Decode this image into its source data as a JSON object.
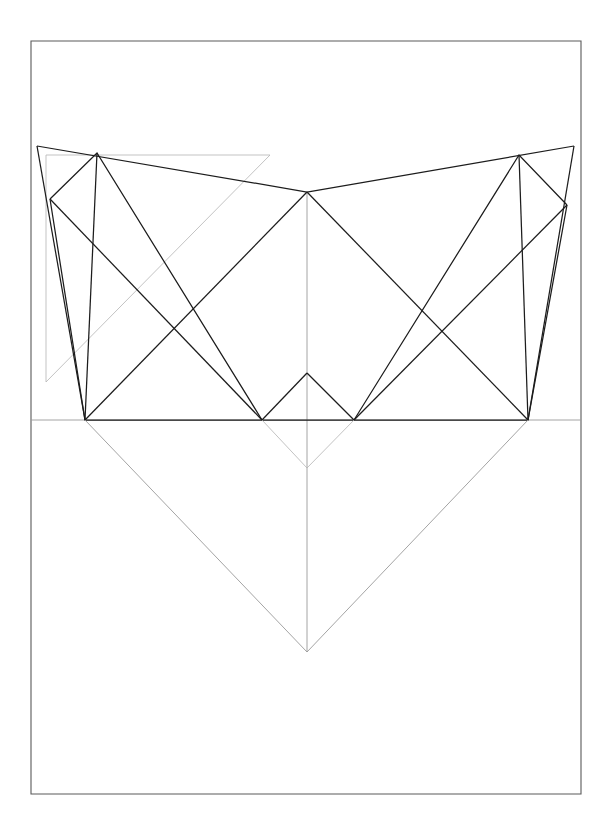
{
  "document": {
    "title": "Descriptive Geometry Construction Drawing",
    "kind": "technical-line-drawing",
    "background_color": "#ffffff",
    "canvas": {
      "width": 614,
      "height": 827
    }
  },
  "styles": {
    "border_color": "#5a5a5a",
    "primary_line_color": "#1c1c1c",
    "construction_line_color": "#9a9a9a",
    "faint_line_color": "#b4b4b4",
    "border_width": 1.1,
    "primary_width": 1.25,
    "construction_width": 0.9,
    "faint_width": 0.8
  },
  "chart_data": {
    "type": "line",
    "title": "Descriptive Geometry Construction Drawing",
    "xlabel": "",
    "ylabel": "",
    "xlim": [
      0,
      614
    ],
    "ylim": [
      0,
      827
    ],
    "grid": false,
    "legend": "none",
    "points": {
      "page_tl": [
        31,
        41
      ],
      "page_tr": [
        581,
        41
      ],
      "page_br": [
        581,
        794
      ],
      "page_bl": [
        31,
        794
      ],
      "apex_left": [
        37,
        146
      ],
      "apex_center": [
        307,
        192
      ],
      "apex_right": [
        574,
        146
      ],
      "peak_left": [
        97,
        153
      ],
      "peak_right": [
        519,
        155
      ],
      "edge_left": [
        50,
        199
      ],
      "edge_right": [
        567,
        205
      ],
      "ground_left": [
        85,
        420
      ],
      "ground_mid_left": [
        262,
        420
      ],
      "ground_mid_right": [
        354,
        420
      ],
      "ground_right": [
        528,
        420
      ],
      "cross_center": [
        307,
        373
      ],
      "cross_left": [
        173,
        327
      ],
      "cross_right": [
        441,
        327
      ],
      "rect_tl": [
        46,
        155
      ],
      "rect_tr": [
        270,
        155
      ],
      "rect_bl": [
        46,
        382
      ],
      "v_bottom": [
        307,
        652
      ],
      "ground_y": 420,
      "center_x": 307
    },
    "series": [
      {
        "name": "page-border",
        "style": "border",
        "closed": true,
        "vertices": [
          [
            31,
            41
          ],
          [
            581,
            41
          ],
          [
            581,
            794
          ],
          [
            31,
            794
          ]
        ]
      },
      {
        "name": "ground-line",
        "style": "construction",
        "closed": false,
        "vertices": [
          [
            31,
            420
          ],
          [
            581,
            420
          ]
        ]
      },
      {
        "name": "center-vertical-axis",
        "style": "construction",
        "closed": false,
        "vertices": [
          [
            307,
            192
          ],
          [
            307,
            652
          ]
        ]
      },
      {
        "name": "auxiliary-rectangle",
        "style": "faint",
        "closed": false,
        "vertices": [
          [
            46,
            382
          ],
          [
            46,
            155
          ],
          [
            270,
            155
          ]
        ]
      },
      {
        "name": "auxiliary-diagonal",
        "style": "faint",
        "closed": false,
        "vertices": [
          [
            270,
            155
          ],
          [
            46,
            382
          ]
        ]
      },
      {
        "name": "outer-chevron-top",
        "style": "primary",
        "closed": false,
        "vertices": [
          [
            37,
            146
          ],
          [
            307,
            192
          ],
          [
            574,
            146
          ]
        ]
      },
      {
        "name": "outer-chevron-left-leg",
        "style": "primary",
        "closed": false,
        "vertices": [
          [
            37,
            146
          ],
          [
            85,
            420
          ]
        ]
      },
      {
        "name": "outer-chevron-right-leg",
        "style": "primary",
        "closed": false,
        "vertices": [
          [
            574,
            146
          ],
          [
            528,
            420
          ]
        ]
      },
      {
        "name": "left-square-upper",
        "style": "primary",
        "closed": false,
        "vertices": [
          [
            50,
            199
          ],
          [
            97,
            153
          ],
          [
            262,
            420
          ],
          [
            85,
            420
          ],
          [
            50,
            199
          ]
        ]
      },
      {
        "name": "left-square-diagonal-a",
        "style": "primary",
        "closed": false,
        "vertices": [
          [
            97,
            153
          ],
          [
            85,
            420
          ]
        ]
      },
      {
        "name": "left-square-diagonal-b",
        "style": "primary",
        "closed": false,
        "vertices": [
          [
            50,
            199
          ],
          [
            262,
            420
          ]
        ]
      },
      {
        "name": "right-square-upper",
        "style": "primary",
        "closed": false,
        "vertices": [
          [
            567,
            205
          ],
          [
            519,
            155
          ],
          [
            354,
            420
          ],
          [
            528,
            420
          ],
          [
            567,
            205
          ]
        ]
      },
      {
        "name": "right-square-diagonal-a",
        "style": "primary",
        "closed": false,
        "vertices": [
          [
            519,
            155
          ],
          [
            528,
            420
          ]
        ]
      },
      {
        "name": "right-square-diagonal-b",
        "style": "primary",
        "closed": false,
        "vertices": [
          [
            567,
            205
          ],
          [
            354,
            420
          ]
        ]
      },
      {
        "name": "center-diamond-left-upper",
        "style": "primary",
        "closed": false,
        "vertices": [
          [
            307,
            192
          ],
          [
            85,
            420
          ]
        ]
      },
      {
        "name": "center-diamond-right-upper",
        "style": "primary",
        "closed": false,
        "vertices": [
          [
            307,
            192
          ],
          [
            528,
            420
          ]
        ]
      },
      {
        "name": "center-diamond-base",
        "style": "primary",
        "closed": false,
        "vertices": [
          [
            262,
            420
          ],
          [
            354,
            420
          ]
        ]
      },
      {
        "name": "center-diamond-left-lower",
        "style": "primary",
        "closed": false,
        "vertices": [
          [
            262,
            420
          ],
          [
            307,
            373
          ]
        ]
      },
      {
        "name": "center-diamond-right-lower",
        "style": "primary",
        "closed": false,
        "vertices": [
          [
            354,
            420
          ],
          [
            307,
            373
          ]
        ]
      },
      {
        "name": "projection-v-left",
        "style": "construction",
        "closed": false,
        "vertices": [
          [
            85,
            420
          ],
          [
            307,
            652
          ]
        ]
      },
      {
        "name": "projection-v-right",
        "style": "construction",
        "closed": false,
        "vertices": [
          [
            528,
            420
          ],
          [
            307,
            652
          ]
        ]
      },
      {
        "name": "inner-projection-v-left",
        "style": "faint",
        "closed": false,
        "vertices": [
          [
            262,
            420
          ],
          [
            307,
            468
          ]
        ]
      },
      {
        "name": "inner-projection-v-right",
        "style": "faint",
        "closed": false,
        "vertices": [
          [
            354,
            420
          ],
          [
            307,
            468
          ]
        ]
      }
    ]
  }
}
